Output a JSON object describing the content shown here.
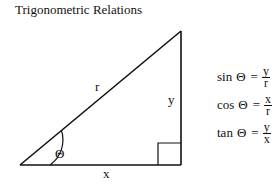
{
  "title": "Trigonometric Relations",
  "diagram": {
    "type": "right-triangle",
    "labels": {
      "hypotenuse": "r",
      "opposite": "y",
      "adjacent": "x",
      "angle": "Θ"
    }
  },
  "equations": [
    {
      "fn": "sin",
      "var": "Θ",
      "eq": "=",
      "num": "y",
      "den": "r"
    },
    {
      "fn": "cos",
      "var": "Θ",
      "eq": "=",
      "num": "x",
      "den": "r"
    },
    {
      "fn": "tan",
      "var": "Θ",
      "eq": "=",
      "num": "y",
      "den": "x"
    }
  ]
}
